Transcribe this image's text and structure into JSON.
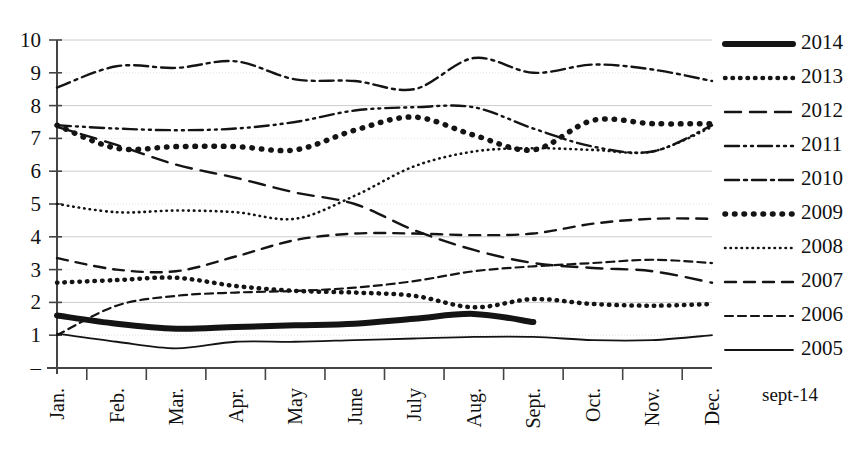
{
  "chart_data": {
    "type": "line",
    "title": "",
    "subtitle": "",
    "xlabel": "",
    "ylabel": "",
    "xlim": [
      0,
      11
    ],
    "ylim": [
      0,
      10
    ],
    "grid": true,
    "legend_position": "right",
    "y_ticks": [
      "10",
      "9",
      "8",
      "7",
      "6",
      "5",
      "4",
      "3",
      "2",
      "1",
      "–"
    ],
    "y_tick_values": [
      10,
      9,
      8,
      7,
      6,
      5,
      4,
      3,
      2,
      1,
      0
    ],
    "categories": [
      "Jan.",
      "Feb.",
      "Mar.",
      "Apr.",
      "May",
      "June",
      "July",
      "Aug.",
      "Sept.",
      "Oct.",
      "Nov.",
      "Dec."
    ],
    "annotation": "sept-14",
    "series": [
      {
        "name": "2014",
        "style": "solid-thick",
        "stroke_width": 6,
        "dash": "none",
        "values": [
          1.6,
          1.35,
          1.2,
          1.25,
          1.3,
          1.35,
          1.5,
          1.65,
          1.4,
          null,
          null,
          null
        ]
      },
      {
        "name": "2013",
        "style": "dotted-medium",
        "stroke_width": 4.5,
        "dash": "0.5,7",
        "values": [
          2.6,
          2.68,
          2.75,
          2.5,
          2.35,
          2.3,
          2.2,
          1.85,
          2.1,
          1.95,
          1.9,
          1.95
        ]
      },
      {
        "name": "2012",
        "style": "long-dash",
        "stroke_width": 2.4,
        "dash": "16,9",
        "values": [
          7.35,
          6.8,
          6.2,
          5.8,
          5.35,
          5.0,
          4.2,
          3.6,
          3.2,
          3.05,
          2.95,
          2.6
        ]
      },
      {
        "name": "2011",
        "style": "dash-dot-dot",
        "stroke_width": 2.4,
        "dash": "14,5,2,5,2,5",
        "values": [
          7.4,
          7.3,
          7.25,
          7.3,
          7.5,
          7.85,
          7.95,
          7.95,
          7.3,
          6.75,
          6.6,
          7.4
        ]
      },
      {
        "name": "2010",
        "style": "dash-dot",
        "stroke_width": 2.4,
        "dash": "14,5,3,5",
        "values": [
          8.55,
          9.2,
          9.15,
          9.35,
          8.8,
          8.75,
          8.5,
          9.45,
          9.0,
          9.25,
          9.1,
          8.75
        ]
      },
      {
        "name": "2009",
        "style": "dotted-heavy",
        "stroke_width": 5.5,
        "dash": "0.5,9",
        "values": [
          7.4,
          6.7,
          6.75,
          6.75,
          6.65,
          7.25,
          7.65,
          7.1,
          6.65,
          7.55,
          7.45,
          7.45
        ]
      },
      {
        "name": "2008",
        "style": "dotted-fine",
        "stroke_width": 2.6,
        "dash": "0.5,5",
        "values": [
          5.0,
          4.75,
          4.8,
          4.75,
          4.55,
          5.25,
          6.15,
          6.6,
          6.7,
          6.65,
          6.6,
          7.35
        ]
      },
      {
        "name": "2007",
        "style": "medium-dash",
        "stroke_width": 2.4,
        "dash": "11,8",
        "values": [
          3.35,
          3.0,
          2.95,
          3.4,
          3.9,
          4.1,
          4.1,
          4.05,
          4.1,
          4.4,
          4.55,
          4.55
        ]
      },
      {
        "name": "2006",
        "style": "short-dash",
        "stroke_width": 2.2,
        "dash": "8,5",
        "values": [
          1.0,
          1.9,
          2.2,
          2.3,
          2.35,
          2.45,
          2.65,
          2.95,
          3.1,
          3.2,
          3.3,
          3.2
        ]
      },
      {
        "name": "2005",
        "style": "solid-thin",
        "stroke_width": 1.8,
        "dash": "none",
        "values": [
          1.05,
          0.8,
          0.6,
          0.8,
          0.8,
          0.85,
          0.9,
          0.95,
          0.95,
          0.85,
          0.85,
          1.0
        ]
      }
    ]
  },
  "colors": {
    "ink": "#141414",
    "gridline": "#cccccc",
    "gridline_light": "#e2e2e2",
    "axis": "#444444",
    "background": "#ffffff"
  },
  "legend": {
    "items": [
      {
        "label": "2014"
      },
      {
        "label": "2013"
      },
      {
        "label": "2012"
      },
      {
        "label": "2011"
      },
      {
        "label": "2010"
      },
      {
        "label": "2009"
      },
      {
        "label": "2008"
      },
      {
        "label": "2007"
      },
      {
        "label": "2006"
      },
      {
        "label": "2005"
      }
    ],
    "footnote": "sept-14"
  }
}
